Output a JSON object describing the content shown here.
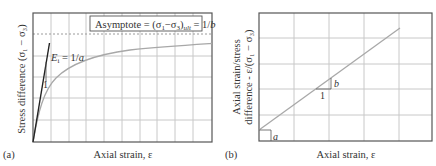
{
  "panel_a": {
    "label": "(a)",
    "xlabel": "Axial strain, ε",
    "ylabel": "Stress difference (σ₁ − σ₃)",
    "asymptote_prefix": "Asymptote = (σ",
    "asymptote_sub1": "1",
    "asymptote_mid": "−σ",
    "asymptote_sub3": "3",
    "asymptote_close": ")",
    "asymptote_sub_ult": "ult",
    "asymptote_eq": " = 1/",
    "asymptote_b": "b",
    "tangent_label_E": "E",
    "tangent_label_sub": "i",
    "tangent_label_eq": " = 1/",
    "tangent_label_a": "a",
    "slope_run_label": "1"
  },
  "panel_b": {
    "label": "(b)",
    "xlabel": "Axial strain, ε",
    "ylabel_line1": "Axial strain/stress",
    "ylabel_line2": "difference - ε/(σ₁ − σ₃)",
    "intercept_label": "a",
    "slope_rise_label": "b",
    "slope_run_label": "1"
  },
  "colors": {
    "frame": "#555555",
    "grid": "#c8c8c8",
    "curve": "#a8a8a8",
    "tangent": "#222222",
    "text": "#333333",
    "dashed": "#9a9a9a"
  }
}
